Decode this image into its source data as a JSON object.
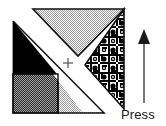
{
  "figure": {
    "background_color": "#ffffff",
    "line_color": "#111111",
    "pieces": [
      {
        "name": "black-triangle",
        "label": "Solid black triangle",
        "fill_style": "solid",
        "fill_color": "#000000",
        "position": "upper-left"
      },
      {
        "name": "dark-checker-square",
        "label": "Dark checkerboard square",
        "fill_style": "checker-dark",
        "fill_color": "#4a4a4a",
        "position": "lower-left"
      },
      {
        "name": "light-checker-triangle-top",
        "label": "Light checkerboard triangle",
        "fill_style": "checker-light",
        "fill_color": "#c9c9c9",
        "position": "top-center"
      },
      {
        "name": "light-checker-triangle-bottom",
        "label": "Light checkerboard triangle",
        "fill_style": "checker-light",
        "fill_color": "#c9c9c9",
        "position": "bottom-center"
      },
      {
        "name": "ornament-triangle",
        "label": "Patterned ornamental triangle",
        "fill_style": "ornament",
        "fill_color": "#000000",
        "position": "right"
      },
      {
        "name": "white-diagonal-band",
        "label": "White diagonal seam band",
        "fill_style": "solid",
        "fill_color": "#ffffff",
        "position": "diagonal-center"
      }
    ],
    "center_mark": {
      "name": "plus-marker",
      "symbol": "+",
      "x": 68,
      "y": 63
    },
    "arrow": {
      "name": "press-direction-arrow",
      "direction": "up",
      "color": "#3f3f3f",
      "tip_x": 144,
      "tip_y": 30,
      "tail_y": 103
    },
    "caption": "Press"
  }
}
